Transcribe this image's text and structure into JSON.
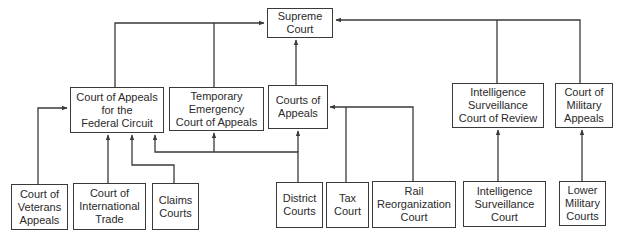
{
  "diagram": {
    "title": "",
    "nodes": [
      {
        "id": "supreme",
        "label": "Supreme\nCourt"
      },
      {
        "id": "cafc",
        "label": "Court of Appeals\nfor the\nFederal Circuit"
      },
      {
        "id": "teca",
        "label": "Temporary\nEmergency\nCourt of Appeals"
      },
      {
        "id": "coa",
        "label": "Courts of\nAppeals"
      },
      {
        "id": "iscr",
        "label": "Intelligence\nSurveillance\nCourt of Review"
      },
      {
        "id": "cma",
        "label": "Court of\nMilitary\nAppeals"
      },
      {
        "id": "cva",
        "label": "Court of\nVeterans\nAppeals"
      },
      {
        "id": "cit",
        "label": "Court of\nInternational\nTrade"
      },
      {
        "id": "claims",
        "label": "Claims\nCourts"
      },
      {
        "id": "district",
        "label": "District\nCourts"
      },
      {
        "id": "tax",
        "label": "Tax\nCourt"
      },
      {
        "id": "rail",
        "label": "Rail\nReorganization\nCourt"
      },
      {
        "id": "isc",
        "label": "Intelligence\nSurveillance\nCourt"
      },
      {
        "id": "lmc",
        "label": "Lower\nMilitary\nCourts"
      }
    ],
    "edges": [
      {
        "from": "cafc",
        "to": "supreme"
      },
      {
        "from": "teca",
        "to": "supreme"
      },
      {
        "from": "coa",
        "to": "supreme"
      },
      {
        "from": "iscr",
        "to": "supreme"
      },
      {
        "from": "cma",
        "to": "supreme"
      },
      {
        "from": "cva",
        "to": "cafc"
      },
      {
        "from": "cit",
        "to": "cafc"
      },
      {
        "from": "claims",
        "to": "cafc"
      },
      {
        "from": "district",
        "to": "cafc"
      },
      {
        "from": "district",
        "to": "teca"
      },
      {
        "from": "district",
        "to": "coa"
      },
      {
        "from": "tax",
        "to": "coa"
      },
      {
        "from": "rail",
        "to": "coa"
      },
      {
        "from": "isc",
        "to": "iscr"
      },
      {
        "from": "lmc",
        "to": "cma"
      }
    ],
    "colors": {
      "line": "#3a3a3a",
      "text": "#2a2a2a",
      "background": "#ffffff"
    }
  }
}
